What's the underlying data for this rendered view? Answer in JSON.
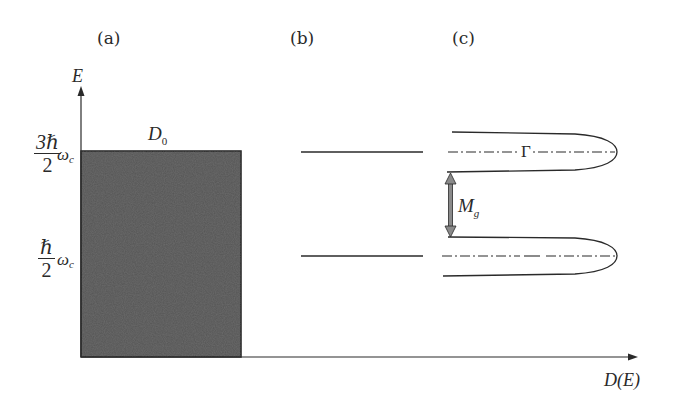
{
  "figure": {
    "panels": {
      "a": "(a)",
      "b": "(b)",
      "c": "(c)"
    },
    "axes": {
      "y_label": "E",
      "x_label": "D(E)",
      "y_ticks": [
        {
          "numerator": "3ℏ",
          "denominator": "2",
          "symbol": "ω",
          "subscript": "c"
        },
        {
          "numerator": "ℏ",
          "denominator": "2",
          "symbol": "ω",
          "subscript": "c"
        }
      ]
    },
    "annotations": {
      "d0_main": "D",
      "d0_sub": "0",
      "gamma": "Γ",
      "mg_main": "M",
      "mg_sub": "g"
    },
    "colors": {
      "block_fill": "#555555",
      "line": "#2a2a2a",
      "arrow_fill": "#8a8a8a"
    }
  }
}
